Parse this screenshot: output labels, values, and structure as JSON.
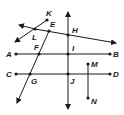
{
  "diagram": {
    "type": "geometry-lines-points",
    "labels": {
      "A": "A",
      "B": "B",
      "C": "C",
      "D": "D",
      "E": "E",
      "F": "F",
      "G": "G",
      "H": "H",
      "I": "I",
      "J": "J",
      "K": "K",
      "L": "L",
      "M": "M",
      "N": "N"
    },
    "points": {
      "A": [
        16,
        54
      ],
      "B": [
        110,
        54
      ],
      "C": [
        16,
        74
      ],
      "D": [
        110,
        74
      ],
      "E": [
        49,
        31
      ],
      "F": [
        39,
        54
      ],
      "G": [
        30,
        74
      ],
      "H": [
        68,
        35
      ],
      "I": [
        68,
        54
      ],
      "J": [
        68,
        74
      ],
      "K": [
        47,
        20
      ],
      "L": [
        35,
        29
      ],
      "M": [
        88,
        64
      ],
      "N": [
        88,
        98
      ]
    },
    "segments_and_lines": [
      {
        "name": "segment-AB",
        "through": [
          "A",
          "I",
          "F",
          "B"
        ],
        "kind": "segment"
      },
      {
        "name": "segment-CD",
        "through": [
          "C",
          "G",
          "J",
          "D"
        ],
        "kind": "segment"
      },
      {
        "name": "segment-MN",
        "through": [
          "M",
          "N"
        ],
        "kind": "segment"
      },
      {
        "name": "line-HIJ",
        "through": [
          "H",
          "I",
          "J"
        ],
        "kind": "line"
      },
      {
        "name": "line-LEH",
        "through": [
          "L",
          "E",
          "H"
        ],
        "kind": "line"
      },
      {
        "name": "ray-KL",
        "through": [
          "K",
          "L"
        ],
        "kind": "ray"
      },
      {
        "name": "ray-EFG",
        "through": [
          "E",
          "F",
          "G"
        ],
        "kind": "ray"
      }
    ]
  }
}
